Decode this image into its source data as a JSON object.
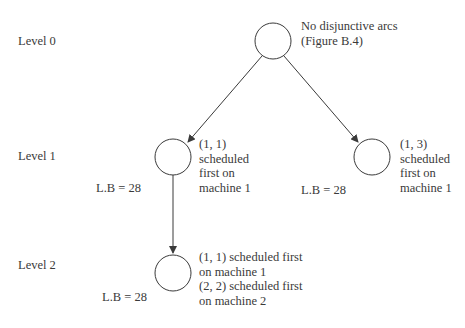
{
  "diagram": {
    "type": "branch-and-bound tree",
    "levels": [
      {
        "label": "Level 0"
      },
      {
        "label": "Level 1"
      },
      {
        "label": "Level 2"
      }
    ],
    "nodes": [
      {
        "id": "root",
        "level": 0,
        "annotation": "No disjunctive arcs\n(Figure B.4)",
        "lower_bound": null
      },
      {
        "id": "n11",
        "level": 1,
        "annotation": "(1, 1)\nscheduled\nfirst on\nmachine 1",
        "lower_bound": "L.B = 28"
      },
      {
        "id": "n13",
        "level": 1,
        "annotation": "(1, 3)\nscheduled\nfirst on\nmachine 1",
        "lower_bound": "L.B = 28"
      },
      {
        "id": "n22",
        "level": 2,
        "annotation": "(1, 1) scheduled first\non machine 1\n(2, 2) scheduled first\non machine 2",
        "lower_bound": "L.B = 28"
      }
    ],
    "edges": [
      {
        "from": "root",
        "to": "n11"
      },
      {
        "from": "root",
        "to": "n13"
      },
      {
        "from": "n11",
        "to": "n22"
      }
    ]
  }
}
